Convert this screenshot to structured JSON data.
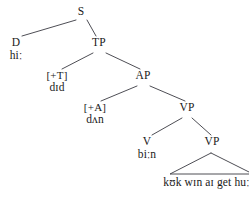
{
  "diagram": {
    "kind": "syntax-tree",
    "title": "",
    "line_color": "#3a3a42",
    "text_color": "#1a1a1a",
    "background": "#ffffff"
  },
  "nodes": {
    "s": {
      "label": "S"
    },
    "d": {
      "label": "D",
      "terminal": "hiː"
    },
    "tp": {
      "label": "TP"
    },
    "t_feature": {
      "label": "[+T]",
      "terminal": "dɪd"
    },
    "ap": {
      "label": "AP"
    },
    "a_feature": {
      "label": "[+A]",
      "terminal": "dʌn"
    },
    "vp_upper": {
      "label": "VP"
    },
    "v": {
      "label": "V",
      "terminal": "biːn"
    },
    "vp_lower": {
      "label": "VP"
    },
    "vp_phrase": {
      "text": "kʊk wɪn aɪ get huːm"
    }
  }
}
